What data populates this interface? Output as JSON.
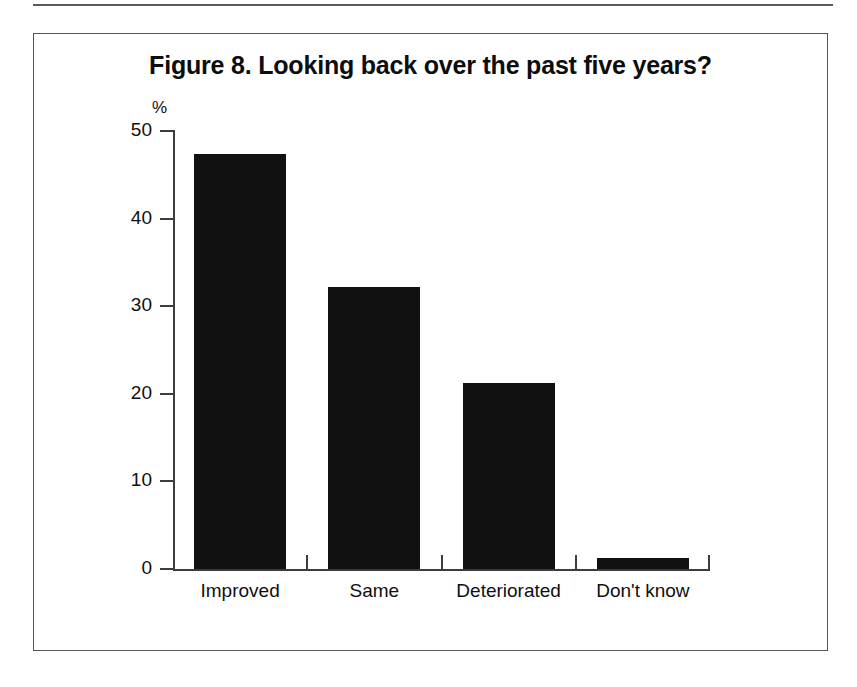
{
  "figure": {
    "title": "Figure 8. Looking back over the past five years?",
    "axis_unit_label": "%"
  },
  "chart_data": {
    "type": "bar",
    "title": "Figure 8. Looking back over the past five years?",
    "categories": [
      "Improved",
      "Same",
      "Deteriorated",
      "Don't know"
    ],
    "values": [
      47.4,
      32.2,
      21.2,
      1.2
    ],
    "xlabel": "",
    "ylabel": "%",
    "ylim": [
      0,
      50
    ],
    "yticks": [
      0,
      10,
      20,
      30,
      40,
      50
    ],
    "ytick_labels": [
      "0",
      "10",
      "20",
      "30",
      "40",
      "50"
    ],
    "grid": false,
    "legend": null,
    "bar_color": "#111111",
    "axis_color": "#3d3d3d",
    "background_color": "#ffffff"
  }
}
